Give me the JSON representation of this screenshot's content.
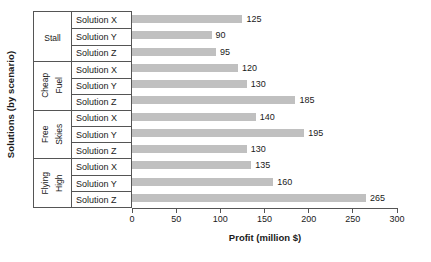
{
  "chart_data": {
    "type": "bar",
    "orientation": "horizontal",
    "title": "",
    "xlabel": "Profit (million $)",
    "ylabel": "Solutions (by scenario)",
    "xlim": [
      0,
      300
    ],
    "xticks": [
      0,
      50,
      100,
      150,
      200,
      250,
      300
    ],
    "xtick_labels": [
      "0",
      "50",
      "100",
      "150",
      "200",
      "250",
      "300"
    ],
    "grid": false,
    "legend": false,
    "bar_color": "#c0c0c0",
    "axis_color": "#555555",
    "value_labels": true,
    "groups": [
      {
        "name": "Stall",
        "name_lines": [
          "Stall"
        ],
        "categories": [
          "Solution X",
          "Solution Y",
          "Solution Z"
        ],
        "values": [
          125,
          90,
          95
        ]
      },
      {
        "name": "Cheap Fuel",
        "name_lines": [
          "Cheap",
          "Fuel"
        ],
        "categories": [
          "Solution X",
          "Solution Y",
          "Solution Z"
        ],
        "values": [
          120,
          130,
          185
        ]
      },
      {
        "name": "Free Skies",
        "name_lines": [
          "Free",
          "Skies"
        ],
        "categories": [
          "Solution X",
          "Solution Y",
          "Solution Z"
        ],
        "values": [
          140,
          195,
          130
        ]
      },
      {
        "name": "Flying High",
        "name_lines": [
          "Flying",
          "High"
        ],
        "categories": [
          "Solution X",
          "Solution Y",
          "Solution Z"
        ],
        "values": [
          135,
          160,
          265
        ]
      }
    ],
    "categories": [
      "Stall / Solution X",
      "Stall / Solution Y",
      "Stall / Solution Z",
      "Cheap Fuel / Solution X",
      "Cheap Fuel / Solution Y",
      "Cheap Fuel / Solution Z",
      "Free Skies / Solution X",
      "Free Skies / Solution Y",
      "Free Skies / Solution Z",
      "Flying High / Solution X",
      "Flying High / Solution Y",
      "Flying High / Solution Z"
    ],
    "values": [
      125,
      90,
      95,
      120,
      130,
      185,
      140,
      195,
      130,
      135,
      160,
      265
    ]
  }
}
